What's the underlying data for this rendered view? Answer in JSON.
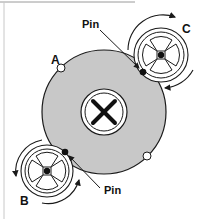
{
  "diagram": {
    "labels": {
      "A": "A",
      "B": "B",
      "C": "C",
      "pin_top": "Pin",
      "pin_bottom": "Pin"
    },
    "colors": {
      "disk_fill": "#c8c8c8",
      "stroke": "#1a1a1a",
      "background": "#ffffff",
      "frame": "#9a9a9a"
    },
    "components": [
      {
        "id": "main-disk",
        "description": "Large grey disk with central cross hub and notches"
      },
      {
        "id": "gear-B",
        "description": "Small four-spoke wheel at lower left with pin engaging disk"
      },
      {
        "id": "gear-C",
        "description": "Small four-spoke wheel at upper right with pin engaging disk"
      }
    ]
  }
}
